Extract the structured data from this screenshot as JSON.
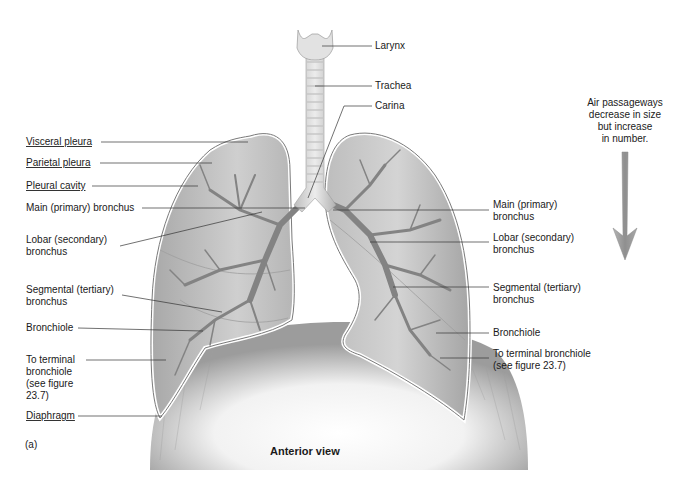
{
  "figure": {
    "panel_label": "(a)",
    "view_title": "Anterior view",
    "annotation": [
      "Air passageways",
      "decrease in size",
      "but increase",
      "in number."
    ],
    "colors": {
      "lung_fill": "#b8b8b8",
      "lung_outline": "#8a8a8a",
      "airway": "#7d7d7d",
      "arrow": "#9a9a9a",
      "leader_line": "#333333",
      "background": "#ffffff"
    }
  },
  "labels": {
    "top": [
      {
        "text": "Larynx"
      },
      {
        "text": "Trachea"
      },
      {
        "text": "Carina"
      }
    ],
    "left": [
      {
        "line1": "Visceral pleura",
        "line2": ""
      },
      {
        "line1": "Parietal pleura",
        "line2": ""
      },
      {
        "line1": "Pleural cavity",
        "line2": ""
      },
      {
        "line1": "Main (primary) bronchus",
        "line2": ""
      },
      {
        "line1": "Lobar (secondary)",
        "line2": "bronchus"
      },
      {
        "line1": "Segmental (tertiary)",
        "line2": "bronchus"
      },
      {
        "line1": "Bronchiole",
        "line2": ""
      },
      {
        "line1": "To terminal",
        "line2": "bronchiole",
        "line3": "(see figure",
        "line4": "23.7)"
      },
      {
        "line1": "Diaphragm",
        "line2": ""
      }
    ],
    "right": [
      {
        "line1": "Main (primary)",
        "line2": "bronchus"
      },
      {
        "line1": "Lobar (secondary)",
        "line2": "bronchus"
      },
      {
        "line1": "Segmental (tertiary)",
        "line2": "bronchus"
      },
      {
        "line1": "Bronchiole",
        "line2": ""
      },
      {
        "line1": "To terminal bronchiole",
        "line2": "(see figure 23.7)"
      }
    ]
  }
}
